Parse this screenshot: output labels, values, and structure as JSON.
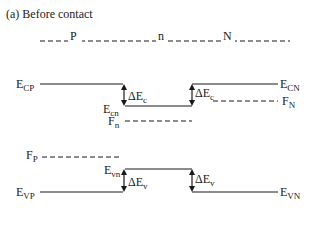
{
  "title": "(a)  Before contact",
  "regions": {
    "p": "P",
    "n": "n",
    "N": "N"
  },
  "levels": {
    "E_CP": {
      "main": "E",
      "sub": "CP"
    },
    "E_cn": {
      "main": "E",
      "sub": "cn"
    },
    "E_CN": {
      "main": "E",
      "sub": "CN"
    },
    "F_N": {
      "main": "F",
      "sub": "N"
    },
    "F_n": {
      "main": "F",
      "sub": "n"
    },
    "F_P": {
      "main": "F",
      "sub": "P"
    },
    "E_vn": {
      "main": "E",
      "sub": "vn"
    },
    "E_VP": {
      "main": "E",
      "sub": "VP"
    },
    "E_VN": {
      "main": "E",
      "sub": "VN"
    }
  },
  "offsets": {
    "dEc_left": {
      "main": "ΔE",
      "sub": "c"
    },
    "dEc_right": {
      "main": "ΔE",
      "sub": "c"
    },
    "dEv_left": {
      "main": "ΔE",
      "sub": "v"
    },
    "dEv_right": {
      "main": "ΔE",
      "sub": "v"
    }
  },
  "colors": {
    "line": "#1a1a1a",
    "background": "#ffffff"
  }
}
